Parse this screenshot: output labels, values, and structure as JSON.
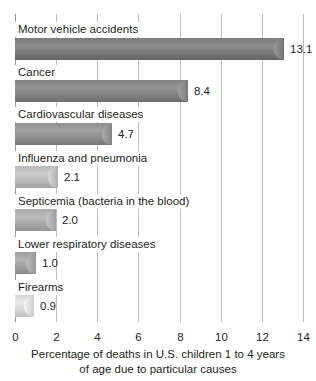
{
  "chart_data": {
    "type": "bar",
    "orientation": "horizontal",
    "title": "",
    "xlabel": "Percentage of deaths in U.S. children 1 to 4 years of age due to particular causes",
    "xlabel_lines": [
      "Percentage of deaths in U.S. children 1 to 4 years",
      "of age due to particular causes"
    ],
    "ylabel": "",
    "categories": [
      "Motor vehicle accidents",
      "Cancer",
      "Cardiovascular diseases",
      "Influenza and pneumonia",
      "Septicemia (bacteria in the blood)",
      "Lower respiratory diseases",
      "Firearms"
    ],
    "values": [
      13.1,
      8.4,
      4.7,
      2.1,
      2.0,
      1.0,
      0.9
    ],
    "value_labels": [
      "13.1",
      "8.4",
      "4.7",
      "2.1",
      "2.0",
      "1.0",
      "0.9"
    ],
    "xlim": [
      0,
      14
    ],
    "xticks": [
      "0",
      "2",
      "4",
      "6",
      "8",
      "10",
      "12",
      "14"
    ],
    "grid": true,
    "legend": "none",
    "bar_colors": [
      "#7b7b7b",
      "#838383",
      "#8f8f8f",
      "#b9b9b9",
      "#a9a9a9",
      "#a0a0a0",
      "#d6d6d6"
    ]
  }
}
